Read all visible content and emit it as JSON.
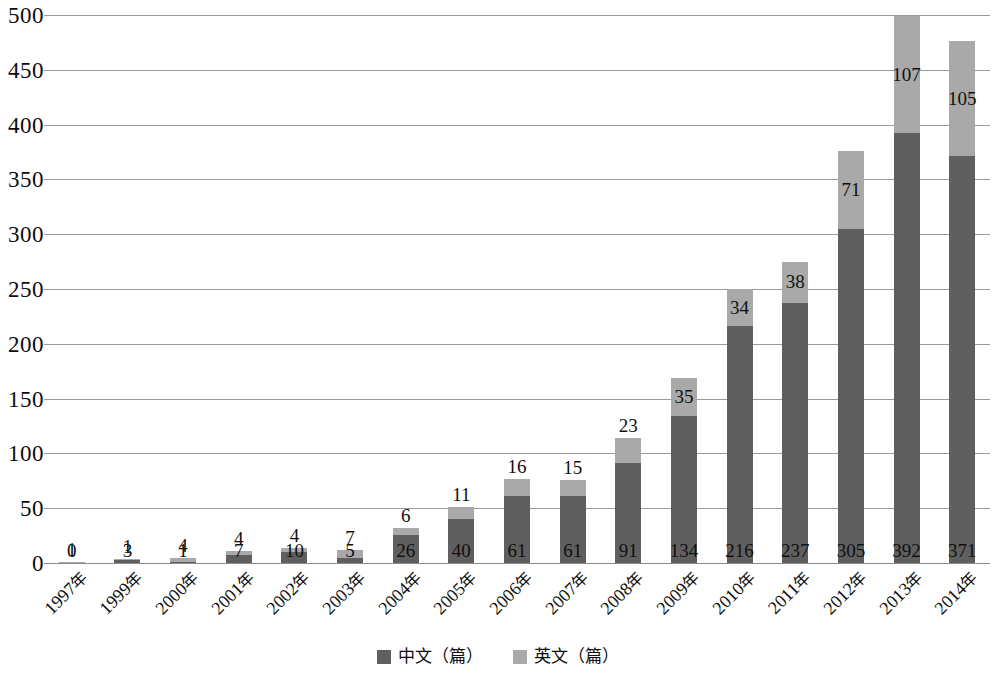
{
  "chart_data": {
    "type": "bar",
    "subtype": "stacked-bar",
    "title": "",
    "subtitle": "",
    "xlabel": "",
    "ylabel": "",
    "ylim": [
      0,
      500
    ],
    "ytick_interval": 50,
    "ytick_labels": [
      "500",
      "450",
      "400",
      "350",
      "300",
      "250",
      "200",
      "150",
      "100",
      "50",
      "0"
    ],
    "ytick_values": [
      500,
      450,
      400,
      350,
      300,
      250,
      200,
      150,
      100,
      50,
      0
    ],
    "grid": true,
    "grid_axis": "y",
    "legend_position": "bottom",
    "categories": [
      "1997年",
      "1999年",
      "2000年",
      "2001年",
      "2002年",
      "2003年",
      "2004年",
      "2005年",
      "2006年",
      "2007年",
      "2008年",
      "2009年",
      "2010年",
      "2011年",
      "2012年",
      "2013年",
      "2014年"
    ],
    "series": [
      {
        "name": "中文（篇）",
        "key": "chinese",
        "color": "#5f5f5f",
        "values": [
          0,
          3,
          1,
          7,
          10,
          5,
          26,
          40,
          61,
          61,
          91,
          134,
          216,
          237,
          305,
          392,
          371
        ]
      },
      {
        "name": "英文（篇）",
        "key": "english",
        "color": "#a9a9a9",
        "values": [
          1,
          1,
          4,
          4,
          4,
          7,
          6,
          11,
          16,
          15,
          23,
          35,
          34,
          38,
          71,
          107,
          105
        ]
      }
    ],
    "totals": [
      1,
      4,
      5,
      11,
      14,
      12,
      32,
      51,
      77,
      76,
      114,
      169,
      250,
      275,
      376,
      499,
      476
    ]
  },
  "legend": {
    "entries": [
      {
        "label": "中文（篇）",
        "color": "#5f5f5f",
        "swatch": "dark-gray-square"
      },
      {
        "label": "英文（篇）",
        "color": "#a9a9a9",
        "swatch": "light-gray-square"
      }
    ]
  },
  "colors": {
    "chinese_bar": "#5f5f5f",
    "english_bar": "#a9a9a9",
    "gridline": "#9a9a9a",
    "text": "#0d0d0d",
    "background": "#ffffff"
  }
}
